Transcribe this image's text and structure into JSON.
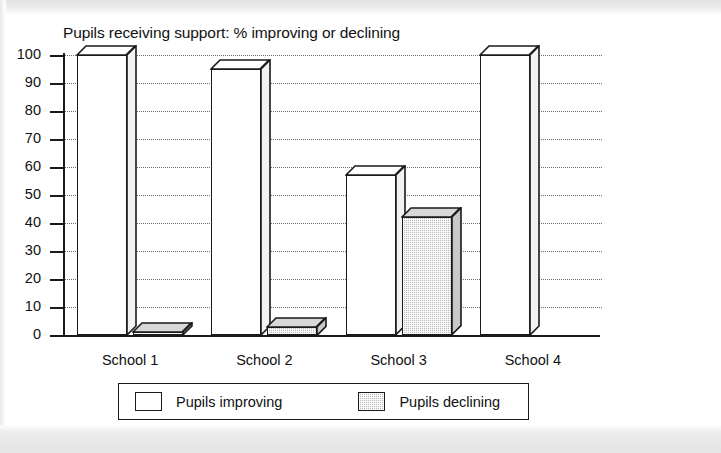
{
  "chart_data": {
    "type": "bar",
    "title": "Pupils receiving support: % improving or declining",
    "xlabel": "",
    "ylabel": "",
    "ylim": [
      0,
      100
    ],
    "yticks": [
      0,
      10,
      20,
      30,
      40,
      50,
      60,
      70,
      80,
      90,
      100
    ],
    "grid": true,
    "legend_position": "bottom",
    "style": "3d-bar",
    "categories": [
      "School 1",
      "School 2",
      "School 3",
      "School 4"
    ],
    "series": [
      {
        "name": "Pupils improving",
        "color": "#ffffff",
        "fill": "solid-white",
        "values": [
          100,
          95,
          57,
          100
        ]
      },
      {
        "name": "Pupils declining",
        "color": "#b9b9b9",
        "fill": "dotted-grey",
        "values": [
          1,
          3,
          42,
          0
        ]
      }
    ]
  },
  "legend": {
    "items": [
      {
        "label": "Pupils improving",
        "swatch": "white-square-icon"
      },
      {
        "label": "Pupils declining",
        "swatch": "grey-hatched-square-icon"
      }
    ]
  }
}
